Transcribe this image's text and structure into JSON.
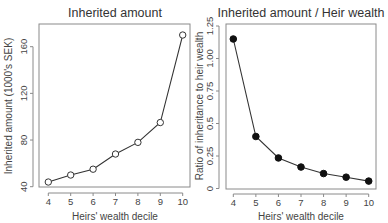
{
  "chart_data": [
    {
      "type": "line",
      "title": "Inherited amount",
      "xlabel": "Heirs' wealth decile",
      "ylabel": "Inherited amount (1000's SEK)",
      "x": [
        4,
        5,
        6,
        7,
        8,
        9,
        10
      ],
      "values": [
        44,
        50,
        55,
        68,
        78,
        95,
        170
      ],
      "marker": "open-circle",
      "xticks": [
        4,
        5,
        6,
        7,
        8,
        9,
        10
      ],
      "yticks": [
        40,
        80,
        120,
        160
      ],
      "ylim": [
        39,
        176
      ],
      "xlim": [
        3.75,
        10.25
      ],
      "grid": false,
      "legend": null
    },
    {
      "type": "line",
      "title": "Inherited amount / Heir wealth",
      "xlabel": "Heirs' wealth decile",
      "ylabel": "Ratio of inheritance to heir wealth",
      "x": [
        4,
        5,
        6,
        7,
        8,
        9,
        10
      ],
      "values": [
        1.15,
        0.4,
        0.235,
        0.165,
        0.115,
        0.087,
        0.057
      ],
      "marker": "filled-circle",
      "xticks": [
        4,
        5,
        6,
        7,
        8,
        9,
        10
      ],
      "yticks": [
        0,
        0.25,
        0.5,
        0.75,
        1.0,
        1.25
      ],
      "ytick_labels": [
        "0",
        "0.25",
        "0.5",
        "0.75",
        "1.00",
        "1.25"
      ],
      "ylim": [
        0,
        1.25
      ],
      "xlim": [
        3.75,
        10.25
      ],
      "grid": false,
      "legend": null
    }
  ],
  "panels": {
    "left": {
      "title": "Inherited amount",
      "xlabel": "Heirs' wealth decile",
      "ylabel": "Inherited amount (1000's SEK)"
    },
    "right": {
      "title": "Inherited amount / Heir wealth",
      "xlabel": "Heirs' wealth decile",
      "ylabel": "Ratio of inheritance to heir wealth"
    }
  }
}
